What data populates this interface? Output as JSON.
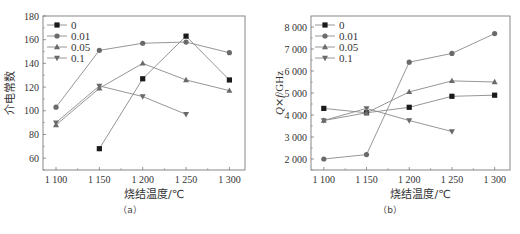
{
  "chart_data": [
    {
      "id": "a",
      "type": "line",
      "caption": "（a）",
      "title": "",
      "xlabel": "烧结温度/℃",
      "ylabel": "介电常数",
      "x": [
        1100,
        1150,
        1200,
        1250,
        1300
      ],
      "x_tick_labels": [
        "1 100",
        "1 150",
        "1 200",
        "1 250",
        "1 300"
      ],
      "y_ticks": [
        60,
        80,
        100,
        120,
        140,
        160,
        180
      ],
      "y_tick_labels": [
        "60",
        "80",
        "100",
        "120",
        "140",
        "160",
        "180"
      ],
      "ylim": [
        50,
        180
      ],
      "xlim": [
        1085,
        1318
      ],
      "grid": false,
      "legend_position": "upper-left",
      "series": [
        {
          "name": "0",
          "marker": "square",
          "values": [
            null,
            68,
            127,
            163,
            126
          ]
        },
        {
          "name": "0.01",
          "marker": "circle",
          "values": [
            103,
            151,
            157,
            158,
            149
          ]
        },
        {
          "name": "0.05",
          "marker": "triangle-up",
          "values": [
            88,
            119,
            140,
            126,
            117
          ]
        },
        {
          "name": "0.1",
          "marker": "triangle-down",
          "values": [
            90,
            121,
            112,
            97,
            null
          ]
        }
      ]
    },
    {
      "id": "b",
      "type": "line",
      "caption": "（b）",
      "title": "",
      "xlabel": "烧结温度/℃",
      "ylabel": "Q×f/GHz",
      "x": [
        1100,
        1150,
        1200,
        1250,
        1300
      ],
      "x_tick_labels": [
        "1 100",
        "1 150",
        "1 200",
        "1 250",
        "1 300"
      ],
      "y_ticks": [
        2000,
        3000,
        4000,
        5000,
        6000,
        7000,
        8000
      ],
      "y_tick_labels": [
        "2 000",
        "3 000",
        "4 000",
        "5 000",
        "6 000",
        "7 000",
        "8 000"
      ],
      "ylim": [
        1500,
        8500
      ],
      "xlim": [
        1085,
        1318
      ],
      "grid": false,
      "legend_position": "upper-left",
      "series": [
        {
          "name": "0",
          "marker": "square",
          "values": [
            4300,
            4100,
            4350,
            4850,
            4900
          ]
        },
        {
          "name": "0.01",
          "marker": "circle",
          "values": [
            2000,
            2200,
            6400,
            6800,
            7700
          ]
        },
        {
          "name": "0.05",
          "marker": "triangle-up",
          "values": [
            3750,
            4100,
            5050,
            5550,
            5500
          ]
        },
        {
          "name": "0.1",
          "marker": "triangle-down",
          "values": [
            3750,
            4300,
            3750,
            3250,
            null
          ]
        }
      ]
    }
  ],
  "layout": [
    {
      "plot": {
        "left": 43,
        "right": 245,
        "top": 16,
        "bottom": 170
      },
      "ylabel_x": 14,
      "caption_x": 130,
      "ylabel_html": "介电常数"
    },
    {
      "plot": {
        "left": 311,
        "right": 510,
        "top": 16,
        "bottom": 170
      },
      "ylabel_x": 283,
      "caption_x": 390
    }
  ],
  "colors": {
    "line": "#8a8a8a",
    "marker_dark": "#1a1a1a",
    "marker_gray": "#6a6a6a",
    "axis": "#7a7a7a",
    "text": "#333333"
  }
}
